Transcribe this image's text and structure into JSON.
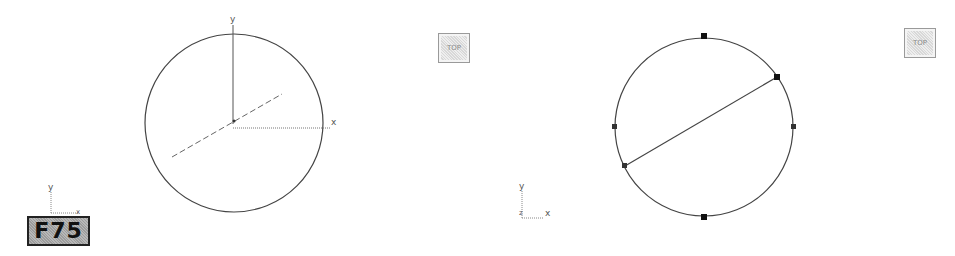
{
  "figure": {
    "badge": "F75",
    "colors": {
      "line": "#444444",
      "axis": "#666666",
      "handle": "#111111",
      "badge_bg": "#aaaaaa"
    }
  },
  "left_view": {
    "view_button": "TOP",
    "circle": {
      "cx": 234,
      "cy": 123,
      "r": 89
    },
    "axes": {
      "y_label": "y",
      "x_label": "x"
    },
    "triad": {
      "y_label": "y",
      "x_label": "x",
      "z_label": "z"
    }
  },
  "right_view": {
    "view_button": "TOP",
    "circle": {
      "cx": 226,
      "cy": 127,
      "r": 89
    },
    "handles": [
      "top",
      "bottom",
      "left",
      "right",
      "diameter-start",
      "diameter-end"
    ],
    "triad": {
      "y_label": "y",
      "x_label": "x",
      "z_label": "z"
    }
  }
}
